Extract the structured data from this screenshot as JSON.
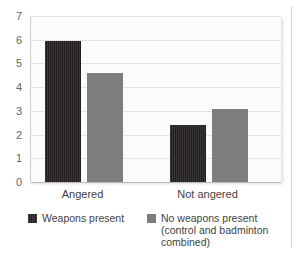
{
  "chart_data": {
    "type": "bar",
    "title": "",
    "subtitle": "",
    "xlabel": "",
    "ylabel": "",
    "categories": [
      "Angered",
      "Not angered"
    ],
    "series": [
      {
        "name": "Weapons present",
        "color": "#231f20",
        "values": [
          5.95,
          2.4
        ]
      },
      {
        "name": "No weapons present (control and badminton combined)",
        "color": "#7d7d7d",
        "values": [
          4.6,
          3.1
        ]
      }
    ],
    "ylim": [
      0,
      7
    ],
    "yticks": [
      "0",
      "1",
      "2",
      "3",
      "4",
      "5",
      "6",
      "7"
    ],
    "grid": true,
    "legend_position": "bottom"
  },
  "legend": {
    "entries": [
      {
        "label": "Weapons present",
        "swatch": "dark-swatch"
      },
      {
        "label": "No weapons present (control and badminton combined)",
        "swatch": "gray-swatch"
      }
    ]
  },
  "colors": {
    "weapons_present": "#231f20",
    "no_weapons_present": "#7d7d7d",
    "gridline": "#e3e3e3",
    "plot_background": "#fbfbfb",
    "axis": "#b9b9b9",
    "text": "#3f3f3f"
  }
}
